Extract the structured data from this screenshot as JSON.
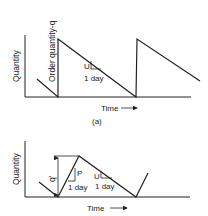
{
  "figure_a": {
    "y_label": "Quantity",
    "x_label": "Time",
    "order_label": "Order quantity-q",
    "slope_label": "U",
    "unit_label": "1 day",
    "caption": "(a)"
  },
  "figure_b": {
    "y_label": "Quantity",
    "x_label": "Time",
    "q_label": "q'",
    "rise_label": "P",
    "rise_unit_label": "1 day",
    "slope_label": "U",
    "unit_label": "1 day"
  },
  "colors": {
    "line": "#222222",
    "background": "#ffffff"
  }
}
